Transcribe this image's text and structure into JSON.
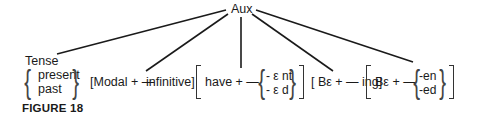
{
  "diagram": {
    "root": "Aux",
    "tense": {
      "label": "Tense",
      "options": [
        "present",
        "past"
      ]
    },
    "modal": {
      "open": "[Modal + —",
      "close": "infinitive]"
    },
    "perfect": {
      "prefix": "have + —",
      "options": [
        "- ε nt",
        "- ε d"
      ]
    },
    "progressive": {
      "text": "[ Bε + — ing]"
    },
    "passive": {
      "prefix": "Bε + —",
      "options": [
        "-en",
        "-ed"
      ]
    },
    "caption": "FIGURE 18"
  }
}
